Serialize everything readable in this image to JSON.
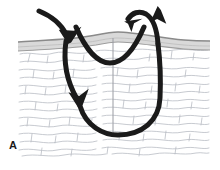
{
  "figure": {
    "panel_label": "A",
    "caption": "",
    "width": 220,
    "height": 170
  },
  "colors": {
    "background": "#ffffff",
    "suture": "#1a1a1a",
    "epidermis_line": "#8d8d8d",
    "epidermis_fill": "#d8d8d8",
    "dermis_fill": "#ffffff",
    "dermis_texture": "#b9bcc4",
    "incision_line": "#9a9ca3",
    "frame": "#e8e8e8",
    "label_text": "#1a1a1a"
  },
  "anatomy": {
    "layers": [
      {
        "id": "epidermis",
        "name": "epidermis",
        "fill": "#d8d8d8",
        "stroke": "#8d8d8d",
        "top_y": 42,
        "bottom_y": 50
      },
      {
        "id": "dermis",
        "name": "dermis",
        "fill": "#ffffff",
        "texture": "#b9bcc4",
        "top_y": 50,
        "bottom_y": 158
      }
    ],
    "surface_profile": {
      "description": "slight central elevation of skin surface",
      "left_x": 18,
      "right_x": 210,
      "baseline_y": 46,
      "peak_x": 113,
      "peak_y": 38
    },
    "incision": {
      "name": "wound-incision-line",
      "x": 113,
      "top_y": 40,
      "bottom_y": 133,
      "stroke": "#9a9ca3",
      "width": 1
    }
  },
  "suture_path": {
    "type": "far-near-near-far vertical mattress",
    "stroke": "#1a1a1a",
    "stroke_width": 5,
    "segments": [
      {
        "id": "entry-approach",
        "name": "entry-approach-stroke",
        "d": "M 39 10 C 52 16, 62 23, 67 35",
        "arrowhead": "down-right",
        "arrow_x": 68,
        "arrow_y": 40
      },
      {
        "id": "far-left-descent",
        "name": "far-left-descending-stroke",
        "d": "M 66 40 C 64 60, 66 78, 76 96",
        "arrowhead": "down",
        "arrow_x": 78,
        "arrow_y": 100
      },
      {
        "id": "deep-loop",
        "name": "deep-u-loop-stroke",
        "d": "M 79 104 C 84 124, 104 134, 117 134 C 140 134, 158 120, 160 96 C 161 76, 160 60, 158 44"
      },
      {
        "id": "far-right-exit",
        "name": "far-right-exit-stroke",
        "d": "M 158 44 C 157 30, 155 20, 148 15 C 141 10, 134 13, 130 18",
        "arrowhead": "down-left",
        "arrow_x": 127,
        "arrow_y": 21
      },
      {
        "id": "near-u-loop",
        "name": "near-superficial-u-stroke",
        "d": "M 77 28 C 86 48, 96 62, 110 62 C 124 62, 134 48, 143 28"
      },
      {
        "id": "near-exit",
        "name": "near-exit-stroke",
        "d": "M 143 28 C 147 20, 151 14, 155 10",
        "arrowhead": "up-right",
        "arrow_x": 158,
        "arrow_y": 7
      }
    ],
    "arrows": [
      {
        "id": "arrow-in-far-left",
        "name": "arrow-entry-down",
        "direction": "down-right",
        "x": 68,
        "y": 40
      },
      {
        "id": "arrow-deep-left",
        "name": "arrow-deep-descend",
        "direction": "down",
        "x": 78,
        "y": 100
      },
      {
        "id": "arrow-out-near",
        "name": "arrow-exit-up",
        "direction": "up-right",
        "x": 158,
        "y": 7
      },
      {
        "id": "arrow-in-near-right",
        "name": "arrow-return-down-left",
        "direction": "down-left",
        "x": 127,
        "y": 21
      }
    ]
  }
}
